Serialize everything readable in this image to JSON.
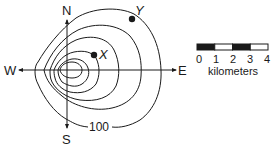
{
  "compass": {
    "north": "N",
    "south": "S",
    "east": "E",
    "west": "W"
  },
  "points": [
    {
      "label": "X",
      "x": 94,
      "y": 55
    },
    {
      "label": "Y",
      "x": 132,
      "y": 19
    }
  ],
  "contour_label": "100",
  "scale_bar": {
    "ticks": [
      "0",
      "1",
      "2",
      "3",
      "4"
    ],
    "unit_label": "kilometers",
    "segments": [
      "black",
      "white",
      "black",
      "white"
    ]
  },
  "colors": {
    "line": "#1a1a1a",
    "background": "#ffffff"
  }
}
